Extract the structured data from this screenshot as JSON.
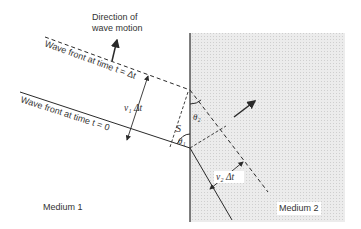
{
  "diagram": {
    "title_labels": {
      "direction_line1": "Direction of",
      "direction_line2": "wave motion"
    },
    "wavefronts": {
      "later": "Wave front at time t = Δt",
      "initial": "Wave front at time t = 0"
    },
    "quantities": {
      "v1dt": "v₁  Δt",
      "v2dt": "v₂  Δt",
      "s": "S",
      "theta1": "θ₁",
      "theta2": "θ₂"
    },
    "media": {
      "medium1": "Medium 1",
      "medium2": "Medium 2"
    },
    "colors": {
      "line": "#2a2a2a",
      "medium2_fill": "#e4e4e4",
      "text": "#333333"
    }
  }
}
